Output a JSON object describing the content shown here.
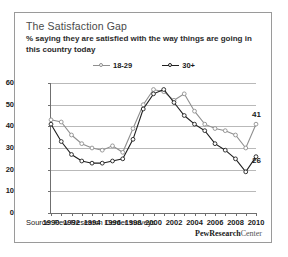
{
  "figure": {
    "title": "The Satisfaction Gap",
    "subtitle": "% saying they are satisfied with the way things are going in this country today",
    "source": "Source: Pew Research Center surveys",
    "logo_primary": "PewResearch",
    "logo_secondary": "Center"
  },
  "colors": {
    "series_young": "#8f8f8f",
    "series_older": "#1f1f1f",
    "grid": "#b9b9b9",
    "axis": "#6f6f6f",
    "border": "#9a9a9a",
    "title_text": "#4a4a4a"
  },
  "chart_data": {
    "type": "line",
    "title": "The Satisfaction Gap",
    "subtitle": "% saying they are satisfied with the way things are going in this country today",
    "xlabel": "",
    "ylabel": "",
    "xlim": [
      1990,
      2010
    ],
    "ylim": [
      0,
      60
    ],
    "yticks": [
      0,
      10,
      20,
      30,
      40,
      50,
      60
    ],
    "xticks": [
      1990,
      1991,
      1992,
      1993,
      1994,
      1995,
      1996,
      1997,
      1998,
      1999,
      2000,
      2001,
      2002,
      2003,
      2004,
      2005,
      2006,
      2007,
      2008,
      2009,
      2010
    ],
    "xtick_labels": [
      "1990",
      "1992",
      "1994",
      "1996",
      "1998",
      "2000",
      "2002",
      "2004",
      "2006",
      "2008",
      "2010"
    ],
    "xtick_labeled_years": [
      1990,
      1992,
      1994,
      1996,
      1998,
      2000,
      2002,
      2004,
      2006,
      2008,
      2010
    ],
    "grid": true,
    "legend_position": "top-center",
    "x": [
      1990,
      1991,
      1992,
      1993,
      1994,
      1995,
      1996,
      1997,
      1998,
      1999,
      2000,
      2001,
      2002,
      2003,
      2004,
      2005,
      2006,
      2007,
      2008,
      2009,
      2010
    ],
    "series": [
      {
        "name": "18-29",
        "color": "#8f8f8f",
        "end_label": "41",
        "values": [
          43,
          42,
          36,
          32,
          30,
          29,
          31,
          28,
          39,
          50,
          57,
          56,
          52,
          55,
          47,
          41,
          39,
          38,
          36,
          30,
          41
        ]
      },
      {
        "name": "30+",
        "color": "#1f1f1f",
        "end_label": "26",
        "values": [
          41,
          33,
          27,
          24,
          23,
          23,
          24,
          25,
          34,
          48,
          55,
          57,
          51,
          45,
          41,
          38,
          32,
          29,
          25,
          19,
          26
        ]
      }
    ]
  }
}
